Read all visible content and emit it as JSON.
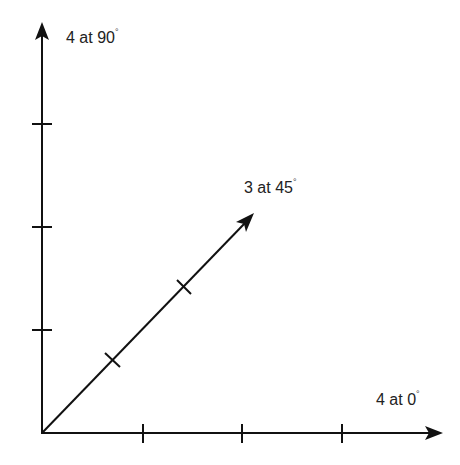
{
  "diagram": {
    "type": "vector-diagram",
    "line_color": "#111111",
    "background": "#ffffff",
    "origin": {
      "x": 42,
      "y": 433
    },
    "unit_px": 100,
    "vectors": [
      {
        "name": "vector-0deg",
        "magnitude": 4,
        "angle_deg": 0,
        "label_main": "4 at 0",
        "label_degree": "°"
      },
      {
        "name": "vector-45deg",
        "magnitude": 3,
        "angle_deg": 45,
        "label_main": "3 at 45",
        "label_degree": "°"
      },
      {
        "name": "vector-90deg",
        "magnitude": 4,
        "angle_deg": 90,
        "label_main": "4 at 90",
        "label_degree": "°"
      }
    ]
  }
}
